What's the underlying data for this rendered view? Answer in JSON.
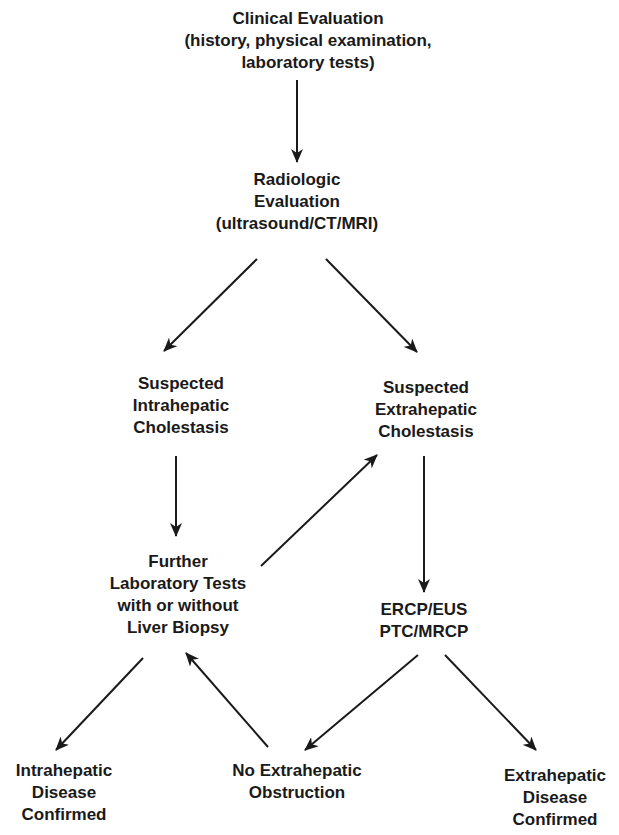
{
  "nodes": {
    "clinical": {
      "lines": [
        "Clinical Evaluation",
        "(history, physical examination,",
        "laboratory tests)"
      ]
    },
    "radiologic": {
      "lines": [
        "Radiologic",
        "Evaluation",
        "(ultrasound/CT/MRI)"
      ]
    },
    "intra_suspected": {
      "lines": [
        "Suspected",
        "Intrahepatic",
        "Cholestasis"
      ]
    },
    "extra_suspected": {
      "lines": [
        "Suspected",
        "Extrahepatic",
        "Cholestasis"
      ]
    },
    "further_tests": {
      "lines": [
        "Further",
        "Laboratory Tests",
        "with or without",
        "Liver Biopsy"
      ]
    },
    "ercp": {
      "lines": [
        "ERCP/EUS",
        "PTC/MRCP"
      ]
    },
    "intra_confirmed": {
      "lines": [
        "Intrahepatic",
        "Disease",
        "Confirmed"
      ]
    },
    "no_obstruction": {
      "lines": [
        "No Extrahepatic",
        "Obstruction"
      ]
    },
    "extra_confirmed": {
      "lines": [
        "Extrahepatic",
        "Disease",
        "Confirmed"
      ]
    }
  },
  "edges": [
    {
      "from": "clinical",
      "to": "radiologic"
    },
    {
      "from": "radiologic",
      "to": "intra_suspected"
    },
    {
      "from": "radiologic",
      "to": "extra_suspected"
    },
    {
      "from": "intra_suspected",
      "to": "further_tests"
    },
    {
      "from": "further_tests",
      "to": "extra_suspected"
    },
    {
      "from": "extra_suspected",
      "to": "ercp"
    },
    {
      "from": "further_tests",
      "to": "intra_confirmed"
    },
    {
      "from": "no_obstruction",
      "to": "further_tests"
    },
    {
      "from": "ercp",
      "to": "no_obstruction"
    },
    {
      "from": "ercp",
      "to": "extra_confirmed"
    }
  ],
  "colors": {
    "ink": "#1a1a1a",
    "background": "#ffffff"
  }
}
